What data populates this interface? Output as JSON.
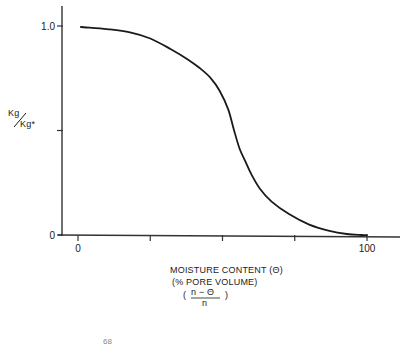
{
  "chart_data": {
    "type": "line",
    "title": "",
    "xlabel": "MOISTURE CONTENT (Θ)",
    "xlabel_line2": "(% PORE VOLUME)",
    "xlabel_formula": {
      "open": "(",
      "numerator": "n − Θ",
      "denominator": "n",
      "close": ")"
    },
    "ylabel": {
      "top": "Kg",
      "bottom": "Kg*",
      "full": "Kg/Kg*"
    },
    "xlim": [
      0,
      100
    ],
    "ylim": [
      0,
      1.0
    ],
    "x_ticks": [
      0,
      25,
      50,
      75,
      100
    ],
    "x_tick_labels": [
      "0",
      "",
      "",
      "",
      "100"
    ],
    "y_ticks": [
      0,
      0.5,
      1.0
    ],
    "y_tick_labels": [
      "0",
      "",
      "1.0"
    ],
    "grid": false,
    "legend": null,
    "series": [
      {
        "name": "Kg/Kg*",
        "x": [
          1,
          10,
          18,
          25,
          32,
          38,
          42,
          46,
          49,
          52,
          54,
          56,
          58,
          60,
          63,
          67,
          73,
          80,
          87,
          93,
          98,
          100
        ],
        "y": [
          0.995,
          0.985,
          0.97,
          0.94,
          0.89,
          0.84,
          0.8,
          0.75,
          0.69,
          0.6,
          0.5,
          0.41,
          0.35,
          0.29,
          0.22,
          0.16,
          0.1,
          0.05,
          0.02,
          0.005,
          0.0,
          0.0
        ]
      }
    ],
    "footnote": "68"
  },
  "colors": {
    "line": "#1a1a1a",
    "axis": "#333333",
    "background": "#ffffff"
  }
}
